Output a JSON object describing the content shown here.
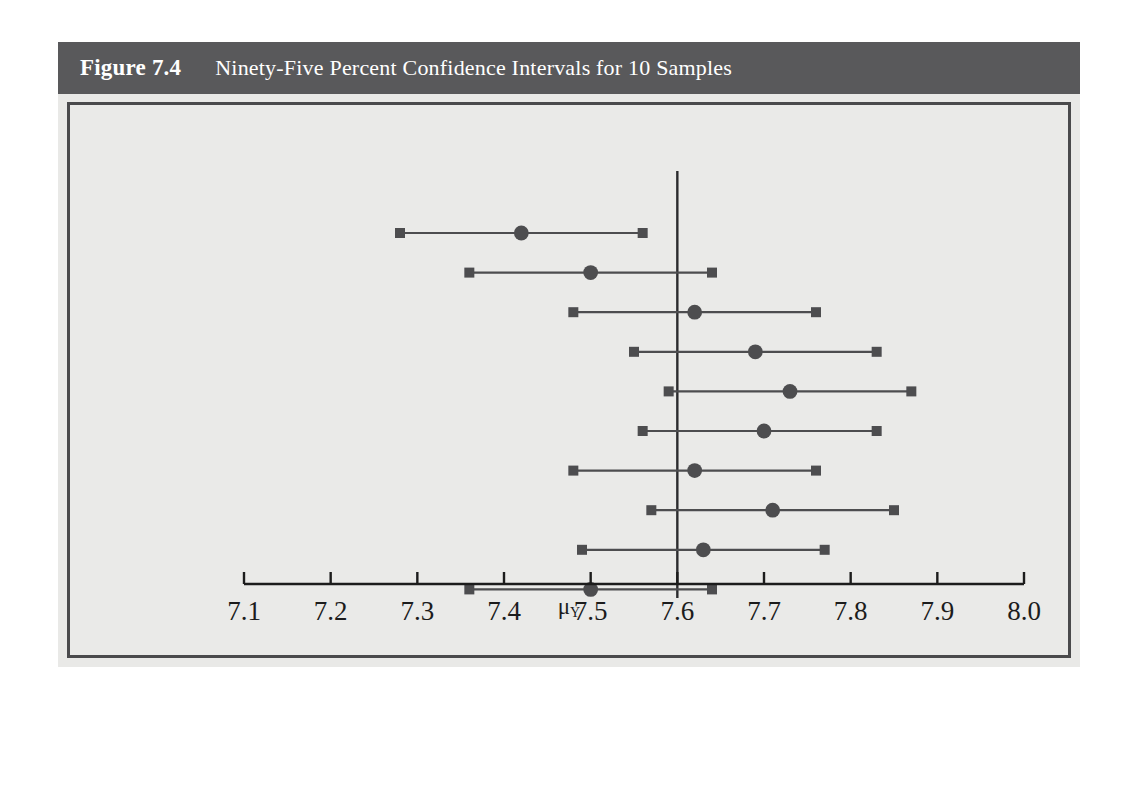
{
  "figure": {
    "number": "Figure 7.4",
    "caption": "Ninety-Five Percent Confidence Intervals for 10 Samples",
    "titlebar_color": "#59595b",
    "panel_background": "#eaeae8",
    "panel_border_color": "#4a4a4c",
    "mark_color": "#4d4d4f"
  },
  "axis_label": {
    "symbol": "μ",
    "subscript": "Y"
  },
  "chart_data": {
    "type": "line",
    "title": "Ninety-Five Percent Confidence Intervals for 10 Samples",
    "xlabel": "μY",
    "ylabel": "",
    "xlim": [
      7.05,
      8.04
    ],
    "ylim": [
      0,
      11
    ],
    "grid": false,
    "legend": "none",
    "xticks": [
      7.1,
      7.2,
      7.3,
      7.4,
      7.5,
      7.6,
      7.7,
      7.8,
      7.9,
      8.0
    ],
    "xtick_labels": [
      "7.1",
      "7.2",
      "7.3",
      "7.4",
      "7.5",
      "7.6",
      "7.7",
      "7.8",
      "7.9",
      "8.0"
    ],
    "reference_line": {
      "orientation": "vertical",
      "value": 7.6,
      "label": "μY"
    },
    "series": [
      {
        "name": "95% confidence intervals",
        "marker": "circle-center-square-endpoints",
        "intervals": [
          {
            "sample": 1,
            "lower": 7.28,
            "center": 7.42,
            "upper": 7.56,
            "contains_mu": false
          },
          {
            "sample": 2,
            "lower": 7.36,
            "center": 7.5,
            "upper": 7.64,
            "contains_mu": true
          },
          {
            "sample": 3,
            "lower": 7.48,
            "center": 7.62,
            "upper": 7.76,
            "contains_mu": true
          },
          {
            "sample": 4,
            "lower": 7.55,
            "center": 7.69,
            "upper": 7.83,
            "contains_mu": true
          },
          {
            "sample": 5,
            "lower": 7.59,
            "center": 7.73,
            "upper": 7.87,
            "contains_mu": true
          },
          {
            "sample": 6,
            "lower": 7.56,
            "center": 7.7,
            "upper": 7.83,
            "contains_mu": true
          },
          {
            "sample": 7,
            "lower": 7.48,
            "center": 7.62,
            "upper": 7.76,
            "contains_mu": true
          },
          {
            "sample": 8,
            "lower": 7.57,
            "center": 7.71,
            "upper": 7.85,
            "contains_mu": true
          },
          {
            "sample": 9,
            "lower": 7.49,
            "center": 7.63,
            "upper": 7.77,
            "contains_mu": true
          },
          {
            "sample": 10,
            "lower": 7.36,
            "center": 7.5,
            "upper": 7.64,
            "contains_mu": true
          }
        ]
      }
    ]
  },
  "background_text": " \n \n \n \n \n \n \n \n \n \n \n \n \n \n \n \n \n \n \n \n "
}
